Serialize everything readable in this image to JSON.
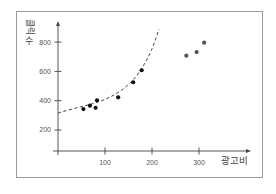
{
  "chart_data": {
    "type": "scatter",
    "title": "",
    "xlabel": "광고비",
    "ylabel": "클릭수",
    "ylabel_parts": {
      "rotated": "클릭",
      "upright": "수"
    },
    "x_ticks": [
      100,
      200,
      300
    ],
    "y_ticks": [
      200,
      400,
      600,
      800
    ],
    "xlim": [
      0,
      410
    ],
    "ylim": [
      55,
      920
    ],
    "grid": false,
    "legend": null,
    "series": [
      {
        "name": "fitted-points",
        "color": "#111111",
        "points": [
          {
            "x": 54,
            "y": 343
          },
          {
            "x": 68,
            "y": 366
          },
          {
            "x": 80,
            "y": 352
          },
          {
            "x": 83,
            "y": 403
          },
          {
            "x": 128,
            "y": 423
          },
          {
            "x": 160,
            "y": 526
          },
          {
            "x": 178,
            "y": 608
          }
        ]
      },
      {
        "name": "outlier-points",
        "color": "#555555",
        "points": [
          {
            "x": 273,
            "y": 707
          },
          {
            "x": 295,
            "y": 732
          },
          {
            "x": 311,
            "y": 796
          }
        ]
      }
    ],
    "trend_curve": {
      "style": "dashed",
      "color": "#333333",
      "points": [
        {
          "x": 0,
          "y": 316
        },
        {
          "x": 38,
          "y": 350
        },
        {
          "x": 71,
          "y": 377
        },
        {
          "x": 102,
          "y": 412
        },
        {
          "x": 130,
          "y": 461
        },
        {
          "x": 156,
          "y": 529
        },
        {
          "x": 178,
          "y": 620
        },
        {
          "x": 198,
          "y": 739
        },
        {
          "x": 215,
          "y": 889
        }
      ]
    }
  },
  "colors": {
    "frame": "#9a9a9a",
    "axis": "#444444"
  }
}
